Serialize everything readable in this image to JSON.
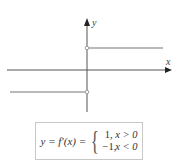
{
  "diagram": {
    "axes": {
      "x_label": "x",
      "y_label": "y",
      "color": "#555555"
    },
    "segments": [
      {
        "name": "positive-branch",
        "y_value": 1,
        "domain": "x > 0",
        "color": "#777777"
      },
      {
        "name": "negative-branch",
        "y_value": -1,
        "domain": "x < 0",
        "color": "#777777"
      }
    ],
    "open_points": [
      {
        "x": 0,
        "y": 1
      },
      {
        "x": 0,
        "y": -1
      }
    ]
  },
  "formula": {
    "lhs": "y = f′(x) =",
    "cases": [
      {
        "value": "1,",
        "condition": "x > 0"
      },
      {
        "value": "−1,",
        "condition": "x < 0"
      }
    ]
  }
}
